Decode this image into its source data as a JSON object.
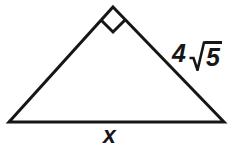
{
  "figure": {
    "type": "right-triangle-geometry-diagram",
    "background_color": "#ffffff",
    "stroke_color": "#161616",
    "stroke_width": 3,
    "vertices": {
      "apex": [
        113,
        7
      ],
      "bottom_left": [
        9,
        122
      ],
      "bottom_right": [
        224,
        122
      ]
    },
    "right_angle": {
      "at_vertex": "apex",
      "marker": "square",
      "marker_size": 18
    },
    "labels": {
      "base": {
        "text": "x",
        "name": "base-length-label",
        "side": "bottom",
        "position": [
          115,
          135
        ]
      },
      "right_leg": {
        "coefficient": "4",
        "radical_symbol": "√",
        "radicand": "5",
        "full_text": "4√5",
        "name": "right-leg-length-label",
        "side": "right",
        "position": [
          200,
          55
        ]
      }
    }
  }
}
